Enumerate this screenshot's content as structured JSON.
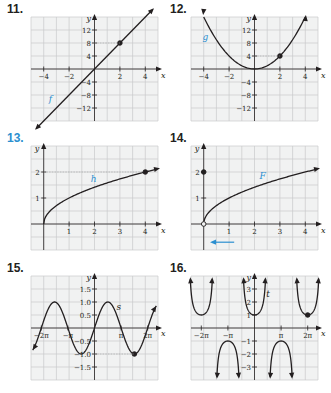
{
  "problems": [
    {
      "number": "11.",
      "color": "#231f20"
    },
    {
      "number": "12.",
      "color": "#231f20"
    },
    {
      "number": "13.",
      "color": "#2b8fd0"
    },
    {
      "number": "14.",
      "color": "#231f20"
    },
    {
      "number": "15.",
      "color": "#231f20"
    },
    {
      "number": "16.",
      "color": "#231f20"
    }
  ],
  "colors": {
    "accent": "#2b8fd0",
    "ink": "#231f20",
    "grid": "#c9cacb",
    "grid_bg": "#f1f2f2"
  },
  "chart_data": [
    {
      "type": "line",
      "id": "11",
      "function_label": "f",
      "xlabel": "x",
      "ylabel": "y",
      "xticks": [
        -4,
        -2,
        2,
        4
      ],
      "yticks": [
        -12,
        -8,
        -4,
        4,
        8,
        12
      ],
      "xlim": [
        -5,
        5
      ],
      "ylim": [
        -16,
        16
      ],
      "equation": "y = 4x (line through origin-ish, slope 4, y-int 0)",
      "points": [
        [
          -4.5,
          -12.5
        ],
        [
          4.5,
          17
        ]
      ],
      "highlight_points": [
        {
          "x": 2,
          "y": 8,
          "style": "filled"
        }
      ],
      "arrows": "both"
    },
    {
      "type": "line",
      "id": "12",
      "function_label": "g",
      "xlabel": "x",
      "ylabel": "y",
      "xticks": [
        -4,
        -2,
        2,
        4
      ],
      "yticks": [
        -12,
        -8,
        -4,
        4,
        8,
        12
      ],
      "xlim": [
        -5,
        5
      ],
      "ylim": [
        -16,
        16
      ],
      "equation": "y = x^2",
      "highlight_points": [
        {
          "x": 2,
          "y": 4,
          "style": "filled"
        }
      ],
      "arrows": "both"
    },
    {
      "type": "line",
      "id": "13",
      "function_label": "h",
      "xlabel": "x",
      "ylabel": "y",
      "xticks": [
        1,
        2,
        3,
        4
      ],
      "yticks": [
        1,
        2
      ],
      "xlim": [
        -0.5,
        4.5
      ],
      "ylim": [
        -1,
        3
      ],
      "equation": "y = sqrt(x)",
      "highlight_points": [
        {
          "x": 4,
          "y": 2,
          "style": "filled"
        }
      ],
      "arrows": "right"
    },
    {
      "type": "line",
      "id": "14",
      "function_label": "F",
      "xlabel": "x",
      "ylabel": "y",
      "xticks": [
        1,
        2,
        3,
        4
      ],
      "yticks": [
        1,
        2
      ],
      "xlim": [
        -0.5,
        4.5
      ],
      "ylim": [
        -1,
        3
      ],
      "equation": "y = sqrt(x), x > 0; F(0) = 2",
      "highlight_points": [
        {
          "x": 0,
          "y": 0,
          "style": "open"
        },
        {
          "x": 0,
          "y": 2,
          "style": "filled"
        }
      ],
      "annotation": "blue arrow pointing left below x-axis",
      "arrows": "right"
    },
    {
      "type": "line",
      "id": "15",
      "function_label": "s",
      "xlabel": "x",
      "ylabel": "y",
      "xticks": [
        "-2π",
        "-π",
        "π",
        "2π"
      ],
      "yticks": [
        -1.5,
        -1.0,
        -0.5,
        0.5,
        1.0,
        1.5
      ],
      "xlim": [
        -7.5,
        7.5
      ],
      "ylim": [
        -2,
        2
      ],
      "equation": "y = sin(x)",
      "highlight_points": [
        {
          "x": "3π/2",
          "y": -1,
          "style": "filled"
        }
      ],
      "arrows": "both"
    },
    {
      "type": "line",
      "id": "16",
      "function_label": "t",
      "xlabel": "x",
      "ylabel": "y",
      "xticks": [
        "-2π",
        "-π",
        "π",
        "2π"
      ],
      "yticks": [
        -3,
        -2,
        -1,
        1,
        2,
        3
      ],
      "xlim": [
        -7.5,
        7.5
      ],
      "ylim": [
        -4,
        4
      ],
      "equation": "y = sec(x)",
      "highlight_points": [
        {
          "x": "2π",
          "y": 1,
          "style": "filled"
        }
      ],
      "arrows": "vertical asymptote arrows"
    }
  ]
}
